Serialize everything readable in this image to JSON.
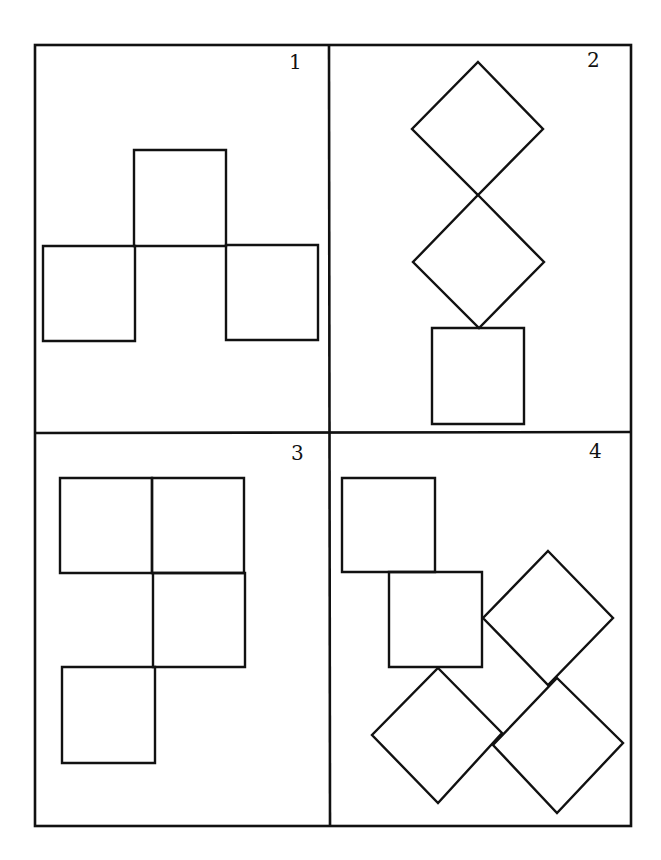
{
  "figure": {
    "colors": {
      "stroke": "#111111",
      "background": "#ffffff"
    },
    "frame": {
      "x1": 35,
      "y1": 45,
      "x2": 631,
      "y2": 826,
      "divider_x": 329,
      "divider_y": 433
    },
    "panels": [
      {
        "label": "1",
        "label_pos": [
          293,
          69
        ],
        "shapes": [
          {
            "type": "square",
            "points": "134,150 226,150 226,246 134,246"
          },
          {
            "type": "square",
            "points": "43,246 135,246 135,341 43,341"
          },
          {
            "type": "square",
            "points": "226,245 318,245 318,340 226,340"
          }
        ]
      },
      {
        "label": "2",
        "label_pos": [
          593,
          67
        ],
        "shapes": [
          {
            "type": "diamond",
            "points": "478,62 543,129 478,195 412,129"
          },
          {
            "type": "diamond",
            "points": "478,195 544,262 479,328 413,262"
          },
          {
            "type": "square",
            "points": "432,328 524,328 524,424 432,424"
          }
        ]
      },
      {
        "label": "3",
        "label_pos": [
          297,
          460
        ],
        "shapes": [
          {
            "type": "square",
            "points": "60,478 152,478 152,573 60,573"
          },
          {
            "type": "square",
            "points": "152,478 244,478 244,573 152,573"
          },
          {
            "type": "square",
            "points": "153,573 245,573 245,667 153,667"
          },
          {
            "type": "square",
            "points": "62,667 155,667 155,763 62,763"
          }
        ]
      },
      {
        "label": "4",
        "label_pos": [
          595,
          458
        ],
        "shapes": [
          {
            "type": "square",
            "points": "342,478 435,478 435,572 342,572"
          },
          {
            "type": "square",
            "points": "389,572 482,572 482,667 389,667"
          },
          {
            "type": "diamond",
            "points": "548,551 613,618 548,685 483,618"
          },
          {
            "type": "diamond",
            "points": "438,668 502,733 438,803 372,735"
          },
          {
            "type": "diamond",
            "points": "557,678 623,743 557,813 493,745"
          }
        ]
      }
    ]
  }
}
